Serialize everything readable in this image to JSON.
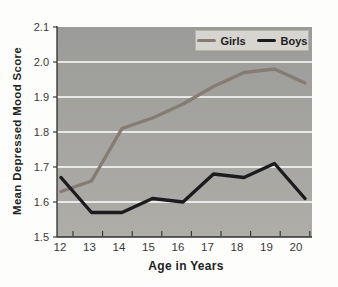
{
  "colors": {
    "page_bg": "#fdfdfc",
    "plot_bg_top": "#9b9b99",
    "plot_bg_bottom": "#aeada8",
    "gridline": "#ffffff",
    "axis": "#2e2f2c",
    "tick_text": "#383936",
    "legend_bg": "#d6d5d0",
    "girls_line": "#867c73",
    "boys_line": "#1c1c20"
  },
  "chart_data": {
    "type": "line",
    "xlabel": "Age in Years",
    "ylabel": "Mean Depressed Mood Score",
    "x": [
      12,
      13,
      14,
      15,
      16,
      17,
      18,
      19,
      20
    ],
    "ylim": [
      1.5,
      2.1
    ],
    "yticks": [
      1.5,
      1.6,
      1.7,
      1.8,
      1.9,
      2.0,
      2.1
    ],
    "grid": true,
    "legend_position": "top-right",
    "series": [
      {
        "name": "Girls",
        "color": "#867c73",
        "values": [
          1.63,
          1.66,
          1.81,
          1.84,
          1.88,
          1.93,
          1.97,
          1.98,
          1.94
        ]
      },
      {
        "name": "Boys",
        "color": "#1c1c20",
        "values": [
          1.67,
          1.57,
          1.57,
          1.61,
          1.6,
          1.68,
          1.67,
          1.71,
          1.61
        ]
      }
    ]
  }
}
